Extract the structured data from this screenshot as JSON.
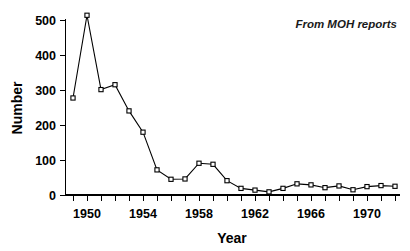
{
  "chart_data": {
    "type": "line",
    "title": "",
    "subtitle": "",
    "xlabel": "Year",
    "ylabel": "Number",
    "xlim": [
      1948.6,
      1972.4
    ],
    "ylim": [
      0,
      530
    ],
    "grid": false,
    "legend": null,
    "annotations": [
      {
        "text": "From MOH reports",
        "x": 1970,
        "y": 490,
        "style": "italic"
      }
    ],
    "x_tick_labels": [
      "1950",
      "1954",
      "1958",
      "1962",
      "1966",
      "1970"
    ],
    "x_tick_values": [
      1950,
      1954,
      1958,
      1962,
      1966,
      1970
    ],
    "x_minor_tick_values": [
      1949,
      1950,
      1951,
      1952,
      1953,
      1954,
      1955,
      1956,
      1957,
      1958,
      1959,
      1960,
      1961,
      1962,
      1963,
      1964,
      1965,
      1966,
      1967,
      1968,
      1969,
      1970,
      1971,
      1972
    ],
    "y_tick_labels": [
      "0",
      "100",
      "200",
      "300",
      "400",
      "500"
    ],
    "y_tick_values": [
      0,
      100,
      200,
      300,
      400,
      500
    ],
    "marker": "open-square",
    "line_color": "#000000",
    "marker_face_color": "#ffffff",
    "marker_edge_color": "#000000",
    "x": [
      1949,
      1950,
      1951,
      1952,
      1953,
      1954,
      1955,
      1956,
      1957,
      1958,
      1959,
      1960,
      1961,
      1962,
      1963,
      1964,
      1965,
      1966,
      1967,
      1968,
      1969,
      1970,
      1971,
      1972
    ],
    "values": [
      278,
      515,
      302,
      316,
      241,
      180,
      72,
      45,
      46,
      91,
      88,
      41,
      19,
      14,
      9,
      19,
      32,
      29,
      21,
      26,
      15,
      24,
      27,
      25
    ],
    "series": [
      {
        "name": "Number",
        "x": [
          1949,
          1950,
          1951,
          1952,
          1953,
          1954,
          1955,
          1956,
          1957,
          1958,
          1959,
          1960,
          1961,
          1962,
          1963,
          1964,
          1965,
          1966,
          1967,
          1968,
          1969,
          1970,
          1971,
          1972
        ],
        "values": [
          278,
          515,
          302,
          316,
          241,
          180,
          72,
          45,
          46,
          91,
          88,
          41,
          19,
          14,
          9,
          19,
          32,
          29,
          21,
          26,
          15,
          24,
          27,
          25
        ]
      }
    ]
  },
  "axes": {
    "y_title": "Number",
    "x_title": "Year"
  },
  "note": {
    "text": "From MOH reports"
  },
  "colors": {
    "background": "#ffffff",
    "foreground": "#000000"
  }
}
